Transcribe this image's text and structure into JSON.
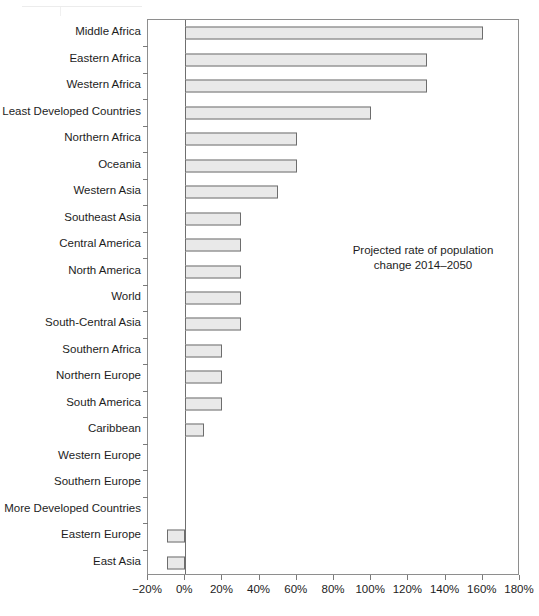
{
  "chart_data": {
    "type": "bar",
    "orientation": "horizontal",
    "title": "",
    "annotation_lines": [
      "Projected rate of population",
      "change 2014–2050"
    ],
    "xlabel": "",
    "ylabel": "",
    "xlim": [
      -20,
      180
    ],
    "xtick_labels": [
      "-20%",
      "0%",
      "20%",
      "40%",
      "60%",
      "80%",
      "100%",
      "120%",
      "140%",
      "160%",
      "180%"
    ],
    "xtick_values": [
      -20,
      0,
      20,
      40,
      60,
      80,
      100,
      120,
      140,
      160,
      180
    ],
    "grid": false,
    "legend": null,
    "units": "percent",
    "categories": [
      "Middle Africa",
      "Eastern Africa",
      "Western Africa",
      "Least Developed Countries",
      "Northern Africa",
      "Oceania",
      "Western Asia",
      "Southeast Asia",
      "Central America",
      "North America",
      "World",
      "South-Central Asia",
      "Southern Africa",
      "Northern Europe",
      "South America",
      "Caribbean",
      "Western Europe",
      "Southern Europe",
      "More Developed Countries",
      "Eastern Europe",
      "East Asia"
    ],
    "values": [
      160,
      130,
      130,
      100,
      60,
      60,
      50,
      30,
      30,
      30,
      30,
      30,
      20,
      20,
      20,
      10,
      0,
      0,
      0,
      -10,
      -10
    ],
    "bar_face_color": "#e9e9e9",
    "bar_edge_color": "#6d6d6d",
    "axis_color": "#8e8e8e"
  }
}
